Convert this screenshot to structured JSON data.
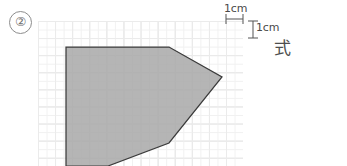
{
  "page": {
    "width": 347,
    "height": 166,
    "background_color": "#ffffff",
    "problem_number": "②"
  },
  "grid": {
    "cell_label": "1cm",
    "cell_size_px": 17.1,
    "minor_divisions": 2,
    "line_color": "#d9d9d9",
    "minor_line_color": "#efefef",
    "origin": {
      "x": 38,
      "y": 21
    },
    "columns": 12,
    "rows": 9
  },
  "dimensions": [
    {
      "name": "horizontal-cell-width",
      "label": "1cm",
      "orientation": "horizontal"
    },
    {
      "name": "vertical-cell-height",
      "label": "1cm",
      "orientation": "vertical"
    }
  ],
  "shape": {
    "name": "shaded-pentagon",
    "fill_color": "#a9a9a9",
    "stroke_color": "#3b3b3b",
    "vertices_px": [
      [
        66,
        47
      ],
      [
        169,
        47
      ],
      [
        222,
        77
      ],
      [
        169,
        143
      ],
      [
        108,
        166
      ],
      [
        66,
        166
      ]
    ],
    "description": "gray shaded polygon on 1cm grid, clipped at page bottom"
  },
  "answer_prompt": {
    "label": "式"
  }
}
